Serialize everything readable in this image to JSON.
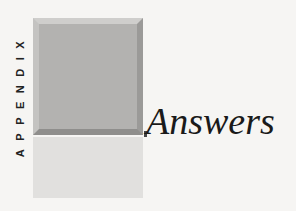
{
  "label": "APPENDIX",
  "title": "Answers",
  "colors": {
    "block_dark": "#b3b2b0",
    "block_light": "#e1e0de",
    "background": "#f6f5f3"
  }
}
